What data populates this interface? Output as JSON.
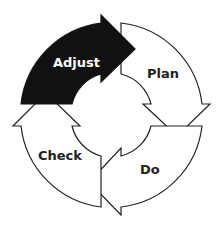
{
  "diagram": {
    "title": "",
    "type": "cycle",
    "stages": [
      {
        "label": "Plan",
        "fill": "#ffffff",
        "stroke": "#222222"
      },
      {
        "label": "Do",
        "fill": "#ffffff",
        "stroke": "#222222"
      },
      {
        "label": "Check",
        "fill": "#ffffff",
        "stroke": "#222222"
      },
      {
        "label": "Adjust",
        "fill": "#111111",
        "stroke": "#111111"
      }
    ],
    "flow": [
      "Plan",
      "Do",
      "Check",
      "Adjust",
      "Plan"
    ]
  }
}
